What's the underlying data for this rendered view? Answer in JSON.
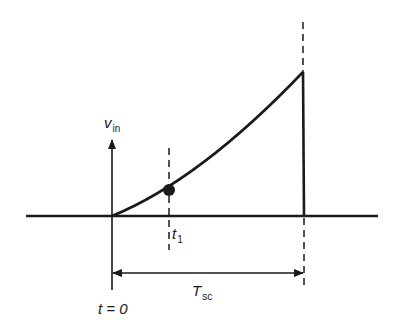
{
  "diagram": {
    "type": "ramp-waveform-timing",
    "labels": {
      "y_axis": {
        "main": "v",
        "sub": "in"
      },
      "t1": {
        "main": "t",
        "sub": "1"
      },
      "t0": "t = 0",
      "period": {
        "main": "T",
        "sub": "sc"
      }
    },
    "colors": {
      "stroke": "#1a1a1a",
      "background": "#ffffff"
    },
    "geometry": {
      "baseline_y": 216,
      "origin_x": 112,
      "t1_x": 171,
      "end_x": 303,
      "peak_y": 72,
      "arrow_y": 273
    }
  }
}
